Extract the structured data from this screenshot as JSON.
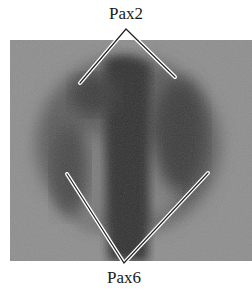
{
  "figure": {
    "labels": {
      "top": "Pax2",
      "bottom": "Pax6"
    },
    "panel": {
      "description": "grayscale micrograph of embryonic tissue",
      "background_color": "#8f8f8f",
      "tissue_color": "#4a4a4a",
      "dark_center_color": "#2e2e2e"
    },
    "pointers": {
      "top": {
        "apex": [
          126,
          29
        ],
        "ends": [
          [
            80,
            83
          ],
          [
            175,
            77
          ]
        ]
      },
      "bottom": {
        "apex": [
          124,
          263
        ],
        "ends": [
          [
            67,
            174
          ],
          [
            208,
            173
          ]
        ]
      }
    }
  }
}
